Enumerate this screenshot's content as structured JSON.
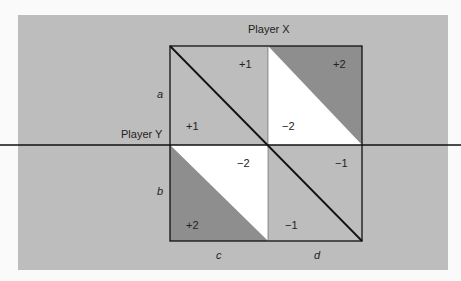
{
  "diagram": {
    "player_x_label": "Player X",
    "player_y_label": "Player Y",
    "row_labels": [
      "a",
      "b"
    ],
    "col_labels": [
      "c",
      "d"
    ],
    "payoffs": {
      "top_right_of_diag_upper_left": "+1",
      "top_upper_right": "+2",
      "top_lower_left": "+1",
      "top_lower_middle": "−2",
      "bottom_upper_middle": "−2",
      "bottom_upper_right": "−1",
      "bottom_lower_left": "+2",
      "bottom_lower_right": "−1"
    },
    "colors": {
      "panel": "#bdbdbd",
      "dark": "#8e8e8e",
      "white": "#ffffff",
      "line": "#111111"
    }
  }
}
